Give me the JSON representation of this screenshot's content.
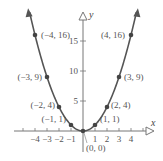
{
  "chart_data": {
    "type": "line",
    "title": "",
    "function": "y = x^2",
    "xlabel": "x",
    "ylabel": "y",
    "xlim": [
      -5,
      5
    ],
    "ylim": [
      0,
      18
    ],
    "x_ticks": [
      -4,
      -3,
      -2,
      -1,
      1,
      2,
      3,
      4
    ],
    "x_tick_labels": [
      "-4",
      "-3",
      "-2",
      "-1",
      "1",
      "2",
      "3",
      "4"
    ],
    "y_ticks": [
      5,
      10,
      15
    ],
    "y_tick_labels": [
      "5",
      "10",
      "15"
    ],
    "points": [
      {
        "x": -4,
        "y": 16,
        "label": "(−4, 16)"
      },
      {
        "x": -3,
        "y": 9,
        "label": "(−3, 9)"
      },
      {
        "x": -2,
        "y": 4,
        "label": "(−2, 4)"
      },
      {
        "x": -1,
        "y": 1,
        "label": "(−1, 1)"
      },
      {
        "x": 0,
        "y": 0,
        "label": "(0, 0)"
      },
      {
        "x": 1,
        "y": 1,
        "label": "(1, 1)"
      },
      {
        "x": 2,
        "y": 4,
        "label": "(2, 4)"
      },
      {
        "x": 3,
        "y": 9,
        "label": "(3, 9)"
      },
      {
        "x": 4,
        "y": 16,
        "label": "(4, 16)"
      }
    ],
    "grid": false,
    "legend": null
  },
  "style": {
    "curve_color": "#555555",
    "point_color": "#444444",
    "axis_color": "#777777",
    "label_color": "#555555"
  }
}
